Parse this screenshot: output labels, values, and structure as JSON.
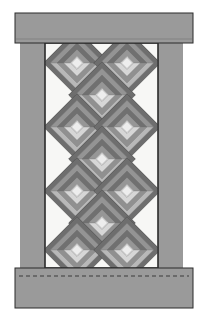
{
  "figure": {
    "type": "quilt-block-diagram",
    "width": 205,
    "height": 321,
    "background": "#ffffff"
  },
  "palette": {
    "frame_gray": "#9a9a9a",
    "frame_gray_shade": "#8e8e8e",
    "outline": "#2b2b2b",
    "panel_white": "#f7f7f5",
    "ring_dark": "#6e6e6e",
    "ring_mid": "#909090",
    "ring_light": "#b8b8b8",
    "ring_pale": "#d6d6d6",
    "center_light": "#ededed",
    "dashed_stitch": "#3a3a3a"
  },
  "frame": {
    "top_valance": {
      "name": "top-valance-bar",
      "x": 15,
      "y": 13,
      "w": 178,
      "h": 30,
      "fill": "#9a9a9a"
    },
    "left_post": {
      "name": "left-frame-post",
      "x": 20,
      "y": 43,
      "w": 25,
      "h": 225,
      "fill": "#9a9a9a"
    },
    "right_post": {
      "name": "right-frame-post",
      "x": 158,
      "y": 43,
      "w": 25,
      "h": 225,
      "fill": "#9a9a9a"
    },
    "bottom_sill": {
      "name": "bottom-sill-bar",
      "x": 15,
      "y": 268,
      "w": 178,
      "h": 40,
      "fill": "#9a9a9a"
    },
    "dashed_line": {
      "name": "stitch-dashed-line",
      "x1": 19,
      "y1": 276,
      "x2": 189,
      "y2": 276,
      "dash": "4 3"
    }
  },
  "panel": {
    "name": "quilt-panel",
    "x": 45,
    "y": 43,
    "w": 113,
    "h": 225,
    "fill": "#f7f7f5",
    "border": "#2b2b2b"
  },
  "blocks": {
    "description": "Diamond (45 degree rotated) log cabin blocks arranged in an offset lattice",
    "block_size": 47,
    "ring_count": 5,
    "columns_offset_pattern": "2-1-2-1-2-1-2",
    "rows": [
      {
        "row": 1,
        "count": 2,
        "cx": [
          77,
          127
        ],
        "cy": 63
      },
      {
        "row": 2,
        "count": 1,
        "cx": [
          102
        ],
        "cy": 95
      },
      {
        "row": 3,
        "count": 2,
        "cx": [
          77,
          127
        ],
        "cy": 127
      },
      {
        "row": 4,
        "count": 1,
        "cx": [
          102
        ],
        "cy": 159
      },
      {
        "row": 5,
        "count": 2,
        "cx": [
          77,
          127
        ],
        "cy": 191
      },
      {
        "row": 6,
        "count": 1,
        "cx": [
          102
        ],
        "cy": 223
      },
      {
        "row": 7,
        "count": 2,
        "cx": [
          77,
          127
        ],
        "cy": 250
      }
    ],
    "ring_fills": [
      "#6e6e6e",
      "#b8b8b8",
      "#909090",
      "#d6d6d6",
      "#ededed"
    ]
  },
  "labels": {
    "none_visible": ""
  }
}
